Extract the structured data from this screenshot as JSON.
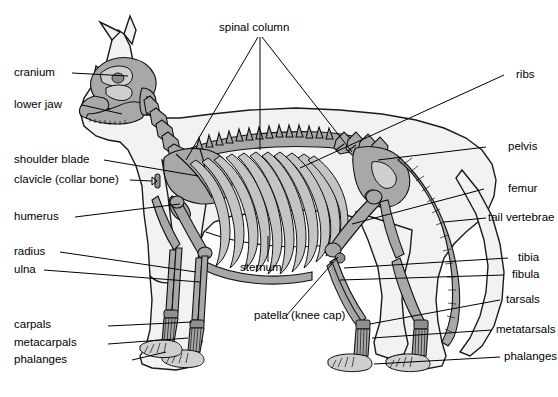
{
  "diagram": {
    "background_color": "#ffffff",
    "line_color": "#000000",
    "bone_fill_mid": "#a8a8a8",
    "bone_fill_light": "#cfcfcf",
    "body_outline_fill": "#f2f2f2",
    "font_size_px": 11.5
  },
  "labels": {
    "spinal_column": "spinal column",
    "cranium": "cranium",
    "lower_jaw": "lower jaw",
    "shoulder_blade": "shoulder blade",
    "clavicle": "clavicle (collar bone)",
    "humerus": "humerus",
    "radius": "radius",
    "ulna": "ulna",
    "carpals": "carpals",
    "metacarpals": "metacarpals",
    "phalanges_front": "phalanges",
    "sternum": "sternum",
    "patella": "patella (knee cap)",
    "ribs": "ribs",
    "pelvis": "pelvis",
    "femur": "femur",
    "tail_vertebrae": "tail vertebrae",
    "tibia": "tibia",
    "fibula": "fibula",
    "tarsals": "tarsals",
    "metatarsals": "metatarsals",
    "phalanges_hind": "phalanges"
  }
}
